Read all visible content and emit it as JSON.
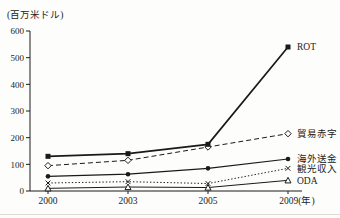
{
  "chart_data": {
    "type": "line",
    "title": "",
    "ylabel": "(百万米ドル)",
    "xlabel": "",
    "x_unit_suffix": "(年)",
    "categories": [
      "2000",
      "2003",
      "2005",
      "2009"
    ],
    "x_axis_labels": [
      "2000",
      "2003",
      "2005",
      "2009(年)"
    ],
    "yticks": [
      0,
      100,
      200,
      300,
      400,
      500,
      600
    ],
    "ylim": [
      0,
      600
    ],
    "grid": false,
    "legend_position": "line-end-labels",
    "color": "#1a1a1a",
    "series": [
      {
        "name": "ROT",
        "values": [
          130,
          140,
          175,
          540
        ],
        "marker": "filled-square",
        "line": "solid",
        "width": 1.7
      },
      {
        "name": "貿易赤字",
        "values": [
          95,
          115,
          165,
          215
        ],
        "marker": "open-diamond",
        "line": "dashed",
        "width": 1
      },
      {
        "name": "海外送金",
        "values": [
          55,
          63,
          85,
          120
        ],
        "marker": "filled-circle",
        "line": "solid",
        "width": 1.2
      },
      {
        "name": "観光収入",
        "values": [
          30,
          35,
          28,
          85
        ],
        "marker": "x",
        "line": "dotted",
        "width": 1
      },
      {
        "name": "ODA",
        "values": [
          10,
          15,
          13,
          40
        ],
        "marker": "open-triangle",
        "line": "solid",
        "width": 1
      }
    ]
  }
}
